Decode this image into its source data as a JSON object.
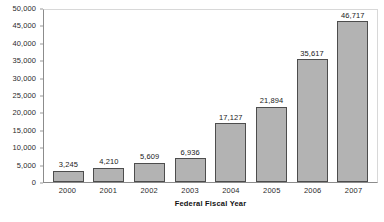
{
  "chart_data": {
    "type": "bar",
    "title": "",
    "subtitle": "",
    "xlabel": "Federal Fiscal Year",
    "ylabel": "",
    "categories": [
      "2000",
      "2001",
      "2002",
      "2003",
      "2004",
      "2005",
      "2006",
      "2007"
    ],
    "values": [
      3245,
      4210,
      5609,
      6936,
      17127,
      21894,
      35617,
      46717
    ],
    "value_labels": [
      "3,245",
      "4,210",
      "5,609",
      "6,936",
      "17,127",
      "21,894",
      "35,617",
      "46,717"
    ],
    "ylim": [
      0,
      50000
    ],
    "ytick_step": 5000,
    "ytick_labels": [
      "50,000",
      "45,000",
      "40,000",
      "35,000",
      "30,000",
      "25,000",
      "20,000",
      "15,000",
      "10,000",
      "5,000",
      "0"
    ],
    "ytick_values": [
      50000,
      45000,
      40000,
      35000,
      30000,
      25000,
      20000,
      15000,
      10000,
      5000,
      0
    ],
    "grid": false,
    "legend": false,
    "legend_position": "none",
    "bar_fill_color": "#b3b3b3",
    "bar_border_color": "#4d4d4d",
    "axis_color": "#8c8c8c",
    "plot_border_color": "#d8d8d8",
    "text_color": "#1a1a1a",
    "data_labels_shown": true
  }
}
